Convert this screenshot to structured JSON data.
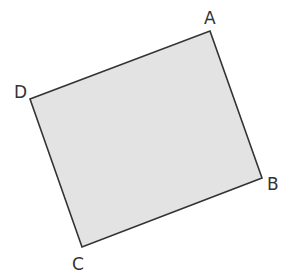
{
  "diagram": {
    "type": "quadrilateral",
    "fill": "#e3e3e3",
    "stroke": "#333333",
    "vertices": [
      {
        "name": "A",
        "x": 210,
        "y": 31,
        "label_x": 204,
        "label_y": 24
      },
      {
        "name": "B",
        "x": 262,
        "y": 178,
        "label_x": 267,
        "label_y": 190
      },
      {
        "name": "C",
        "x": 82,
        "y": 247,
        "label_x": 72,
        "label_y": 270
      },
      {
        "name": "D",
        "x": 30,
        "y": 99,
        "label_x": 14,
        "label_y": 98
      }
    ],
    "labels": {
      "A": "A",
      "B": "B",
      "C": "C",
      "D": "D"
    }
  }
}
